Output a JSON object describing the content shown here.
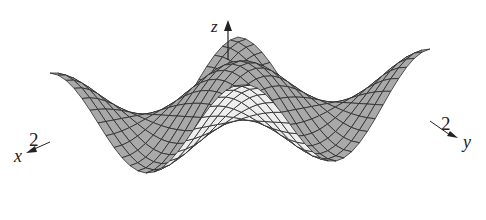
{
  "figure": {
    "axes": {
      "z": {
        "label": "z"
      },
      "x": {
        "label": "x",
        "tick": "2"
      },
      "y": {
        "label": "y",
        "tick": "2"
      }
    }
  },
  "chart_data": {
    "type": "surface",
    "title": "",
    "function": "z = cos(pi*x/2)*cos(pi*y/2)-like: central peak, corner bumps, troughs at edge midpoints",
    "domain": {
      "x": [
        -2,
        2
      ],
      "y": [
        -2,
        2
      ]
    },
    "grid_lines": 24,
    "xlabel": "x",
    "ylabel": "y",
    "zlabel": "z",
    "tick_labels": {
      "x": [
        "2"
      ],
      "y": [
        "2"
      ]
    },
    "colors": {
      "top_face": "#a9a9a9",
      "bottom_face": "#eeeeee",
      "mesh": "#2a2a2a",
      "axis": "#222222"
    }
  }
}
